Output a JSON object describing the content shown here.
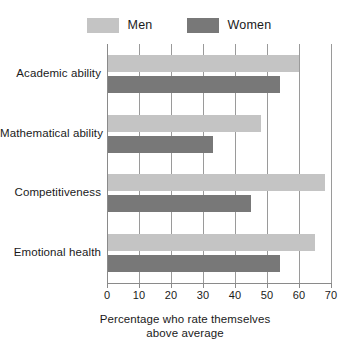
{
  "chart_data": {
    "type": "bar",
    "orientation": "horizontal",
    "title": "",
    "xlabel": "Percentage who rate themselves above average",
    "ylabel": "",
    "xlim": [
      0,
      70
    ],
    "xticks": [
      0,
      10,
      20,
      30,
      40,
      50,
      60,
      70
    ],
    "xtick_labels": [
      "0",
      "10",
      "20",
      "30",
      "40",
      "50",
      "60",
      "70"
    ],
    "grid": true,
    "grid_axis": "x",
    "legend_position": "top-center",
    "categories": [
      "Academic ability",
      "Mathematical ability",
      "Competitiveness",
      "Emotional health"
    ],
    "series": [
      {
        "name": "Men",
        "color": "#c4c4c4",
        "values": [
          60,
          48,
          68,
          65
        ]
      },
      {
        "name": "Women",
        "color": "#787878",
        "values": [
          54,
          33,
          45,
          54
        ]
      }
    ]
  },
  "legend": {
    "entries": [
      {
        "label": "Men",
        "swatch": "legend-swatch-men"
      },
      {
        "label": "Women",
        "swatch": "legend-swatch-women"
      }
    ]
  },
  "axis_title": {
    "line1": "Percentage who rate themselves",
    "line2": "above average"
  },
  "colors": {
    "men": "#c4c4c4",
    "women": "#787878",
    "grid": "#9a9a9a",
    "axis": "#8a8a8a",
    "text": "#1a1a1a",
    "background": "#ffffff"
  }
}
